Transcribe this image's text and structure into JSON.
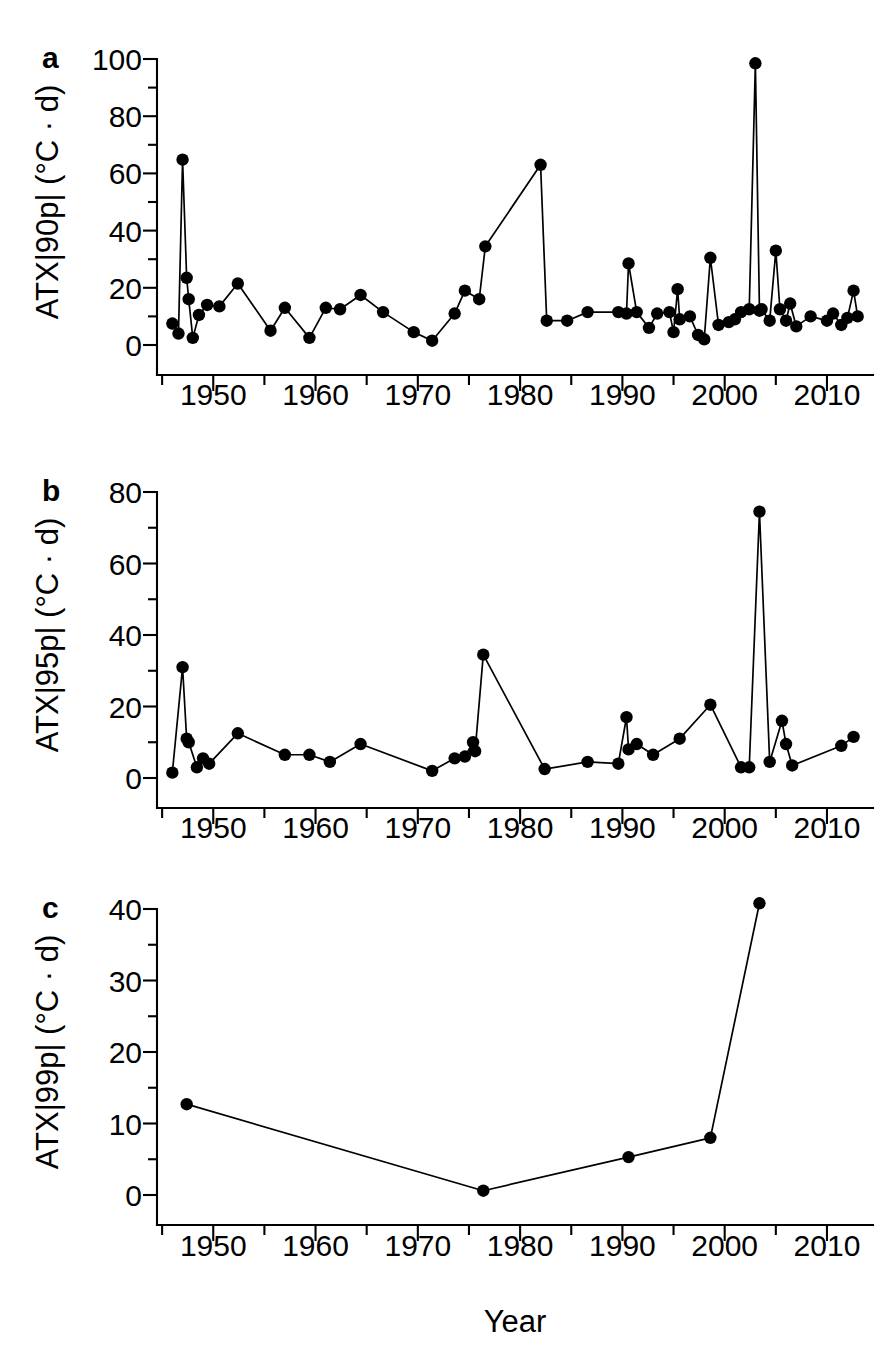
{
  "figure": {
    "panels": [
      "a",
      "b",
      "c"
    ],
    "shared_xlabel": "Year",
    "marker_color": "#000000",
    "line_color": "#000000",
    "background": "#ffffff"
  },
  "panel_a": {
    "letter": "a",
    "ylabel": "ATX|90p| (°C · d)",
    "ytick_labels": [
      "0",
      "20",
      "40",
      "60",
      "80",
      "100"
    ],
    "xtick_labels": [
      "1950",
      "1960",
      "1970",
      "1980",
      "1990",
      "2000",
      "2010"
    ]
  },
  "panel_b": {
    "letter": "b",
    "ylabel": "ATX|95p| (°C · d)",
    "ytick_labels": [
      "0",
      "20",
      "40",
      "60",
      "80"
    ],
    "xtick_labels": [
      "1950",
      "1960",
      "1970",
      "1980",
      "1990",
      "2000",
      "2010"
    ]
  },
  "panel_c": {
    "letter": "c",
    "ylabel": "ATX|99p| (°C · d)",
    "ytick_labels": [
      "0",
      "10",
      "20",
      "30",
      "40"
    ],
    "xtick_labels": [
      "1950",
      "1960",
      "1970",
      "1980",
      "1990",
      "2000",
      "2010"
    ],
    "xlabel": "Year"
  },
  "chart_data": [
    {
      "id": "panel_a",
      "type": "line",
      "title": "a",
      "xlabel": "",
      "ylabel": "ATX|90p| (°C · d)",
      "xlim": [
        1944.5,
        2014.5
      ],
      "ylim": [
        0,
        100
      ],
      "xticks": [
        1950,
        1960,
        1970,
        1980,
        1990,
        2000,
        2010
      ],
      "xminorticks": [
        1945,
        1955,
        1965,
        1975,
        1985,
        1995,
        2005
      ],
      "yticks": [
        0,
        20,
        40,
        60,
        80,
        100
      ],
      "yminorticks": [
        10,
        30,
        50,
        70,
        90
      ],
      "grid": false,
      "legend": null,
      "markers": "filled-circle",
      "x": [
        1946.0,
        1946.6,
        1947.0,
        1947.4,
        1947.6,
        1948.0,
        1948.6,
        1949.4,
        1950.6,
        1952.4,
        1955.6,
        1957.0,
        1959.4,
        1961.0,
        1962.4,
        1964.4,
        1966.6,
        1969.6,
        1971.4,
        1973.6,
        1974.6,
        1976.0,
        1976.6,
        1982.0,
        1982.6,
        1984.6,
        1986.6,
        1989.6,
        1990.4,
        1990.6,
        1991.4,
        1992.6,
        1993.4,
        1994.6,
        1995.0,
        1995.4,
        1995.6,
        1996.6,
        1997.4,
        1998.0,
        1998.6,
        1999.4,
        2000.4,
        2001.0,
        2001.6,
        2002.4,
        2003.0,
        2003.4,
        2003.6,
        2004.4,
        2005.0,
        2005.4,
        2006.0,
        2006.4,
        2007.0,
        2008.4,
        2010.0,
        2010.6,
        2011.4,
        2012.0,
        2012.6,
        2013.0
      ],
      "y": [
        7.5,
        4.0,
        64.8,
        23.5,
        16.0,
        2.5,
        10.5,
        14.0,
        13.5,
        21.5,
        5.0,
        13.0,
        2.5,
        13.0,
        12.5,
        17.5,
        11.5,
        4.5,
        1.5,
        11.0,
        19.0,
        16.0,
        34.5,
        63.0,
        8.5,
        8.5,
        11.5,
        11.5,
        11.0,
        28.5,
        11.5,
        6.0,
        11.0,
        11.5,
        4.5,
        19.5,
        9.0,
        10.0,
        3.5,
        2.0,
        30.5,
        7.0,
        8.0,
        9.0,
        11.5,
        12.5,
        98.5,
        12.0,
        12.5,
        8.5,
        33.0,
        12.5,
        8.5,
        14.5,
        6.5,
        10.0,
        8.5,
        11.0,
        7.0,
        9.5,
        19.0,
        10.0
      ],
      "data_note": "Annual ATX 90th-percentile exceedance magnitude values (°C · d), 1946-2013"
    },
    {
      "id": "panel_b",
      "type": "line",
      "title": "b",
      "xlabel": "",
      "ylabel": "ATX|95p| (°C · d)",
      "xlim": [
        1944.5,
        2014.5
      ],
      "ylim": [
        0,
        80
      ],
      "xticks": [
        1950,
        1960,
        1970,
        1980,
        1990,
        2000,
        2010
      ],
      "xminorticks": [
        1945,
        1955,
        1965,
        1975,
        1985,
        1995,
        2005
      ],
      "yticks": [
        0,
        20,
        40,
        60,
        80
      ],
      "yminorticks": [
        10,
        30,
        50,
        70
      ],
      "grid": false,
      "legend": null,
      "markers": "filled-circle",
      "x": [
        1946.0,
        1947.0,
        1947.4,
        1947.6,
        1948.4,
        1949.0,
        1949.6,
        1952.4,
        1957.0,
        1959.4,
        1961.4,
        1964.4,
        1971.4,
        1973.6,
        1974.6,
        1975.4,
        1975.6,
        1976.4,
        1982.4,
        1986.6,
        1989.6,
        1990.4,
        1990.6,
        1991.4,
        1993.0,
        1995.6,
        1998.6,
        2001.6,
        2002.4,
        2003.4,
        2004.4,
        2005.6,
        2006.0,
        2006.6,
        2011.4,
        2012.6
      ],
      "y": [
        1.5,
        31.0,
        11.0,
        10.0,
        3.0,
        5.5,
        4.0,
        12.5,
        6.5,
        6.5,
        4.5,
        9.5,
        2.0,
        5.5,
        6.0,
        10.0,
        7.5,
        34.5,
        2.5,
        4.5,
        4.0,
        17.0,
        8.0,
        9.5,
        6.5,
        11.0,
        20.5,
        3.0,
        3.0,
        74.5,
        4.5,
        16.0,
        9.5,
        3.5,
        9.0,
        11.5
      ],
      "data_note": "Annual ATX 95th-percentile exceedance magnitude values (°C · d), 1946-2013"
    },
    {
      "id": "panel_c",
      "type": "line",
      "title": "c",
      "xlabel": "Year",
      "ylabel": "ATX|99p| (°C · d)",
      "xlim": [
        1944.5,
        2014.5
      ],
      "ylim": [
        0,
        40
      ],
      "xticks": [
        1950,
        1960,
        1970,
        1980,
        1990,
        2000,
        2010
      ],
      "xminorticks": [
        1945,
        1955,
        1965,
        1975,
        1985,
        1995,
        2005
      ],
      "yticks": [
        0,
        10,
        20,
        30,
        40
      ],
      "yminorticks": [
        5,
        15,
        25,
        35
      ],
      "grid": false,
      "legend": null,
      "markers": "filled-circle",
      "x": [
        1947.4,
        1976.4,
        1990.6,
        1998.6,
        2003.4
      ],
      "y": [
        12.7,
        0.6,
        5.3,
        8.0,
        40.8
      ],
      "data_note": "Annual ATX 99th-percentile exceedance magnitude values (°C · d)"
    }
  ]
}
